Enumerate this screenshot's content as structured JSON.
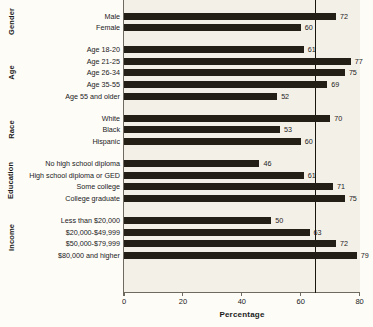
{
  "chart_data": {
    "type": "bar",
    "orientation": "horizontal",
    "title": "",
    "xlabel": "Percentage",
    "ylabel": "",
    "xlim": [
      0,
      85
    ],
    "grid": false,
    "legend": null,
    "xticks": [
      0,
      20,
      40,
      60,
      80
    ],
    "xtick_labels": [
      "0",
      "20",
      "40",
      "60",
      "80"
    ],
    "reference_line": {
      "value": 65,
      "label": ""
    },
    "groups": [
      {
        "name": "Gender",
        "categories": [
          "Male",
          "Female"
        ],
        "values": [
          72,
          60
        ]
      },
      {
        "name": "Age",
        "categories": [
          "Age 18-20",
          "Age 21-25",
          "Age 26-34",
          "Age 35-55",
          "Age 55 and older"
        ],
        "values": [
          61,
          77,
          75,
          69,
          52
        ]
      },
      {
        "name": "Race",
        "categories": [
          "White",
          "Black",
          "Hispanic"
        ],
        "values": [
          70,
          53,
          60
        ]
      },
      {
        "name": "Education",
        "categories": [
          "No high school diploma",
          "High school diploma or GED",
          "Some college",
          "College graduate"
        ],
        "values": [
          46,
          61,
          71,
          75
        ]
      },
      {
        "name": "Income",
        "categories": [
          "Less than $20,000",
          "$20,000-$49,999",
          "$50,000-$79,999",
          "$80,000 and higher"
        ],
        "values": [
          50,
          63,
          72,
          79
        ]
      }
    ]
  },
  "colors": {
    "bar": "#231f16",
    "plot_background": "#f3f0e7",
    "page_background": "#fdfcf7",
    "axis": "#6e6a5f",
    "text": "#1b1b1b",
    "reference_line": "#19150f"
  }
}
